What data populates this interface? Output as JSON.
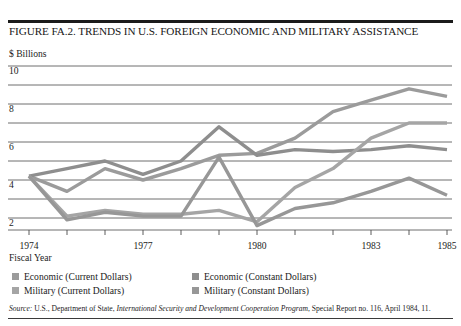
{
  "figure": {
    "title": "FIGURE FA.2. TRENDS IN U.S. FOREIGN ECONOMIC AND MILITARY ASSISTANCE",
    "source_prefix": "Source:",
    "source_part1": " U.S., Department of State, ",
    "source_italic": "International Security and Development Cooperation Program",
    "source_part2": ", Special Report no. 116, April 1984, 11."
  },
  "axes": {
    "y_unit": "$ Billions",
    "x_title": "Fiscal Year",
    "y_ticks": [
      "10",
      "8",
      "6",
      "4",
      "2"
    ],
    "x_ticks": [
      "1974",
      "1977",
      "1980",
      "1983",
      "1985"
    ]
  },
  "legend": {
    "items": [
      {
        "label": "Economic (Current Dollars)",
        "color": "#9b9b9b"
      },
      {
        "label": "Economic (Constant Dollars)",
        "color": "#8e8e8e"
      },
      {
        "label": "Military (Current Dollars)",
        "color": "#a5a5a5"
      },
      {
        "label": "Military (Constant Dollars)",
        "color": "#979797"
      }
    ]
  },
  "chart_data": {
    "type": "line",
    "title": "FIGURE FA.2. TRENDS IN U.S. FOREIGN ECONOMIC AND MILITARY ASSISTANCE",
    "xlabel": "Fiscal Year",
    "ylabel": "$ Billions",
    "xlim": [
      1974,
      1985
    ],
    "ylim": [
      1.2,
      10.4
    ],
    "yticks": [
      2,
      4,
      6,
      8,
      10
    ],
    "y_gridlines": [
      2,
      3,
      4,
      5,
      6,
      7,
      8,
      9,
      10
    ],
    "xticks": [
      1974,
      1977,
      1980,
      1983,
      1985
    ],
    "x_tickmarks": [
      1974,
      1975,
      1976,
      1977,
      1978,
      1979,
      1980,
      1981,
      1982,
      1983,
      1984,
      1985
    ],
    "grid": true,
    "legend_position": "below",
    "x": [
      1974,
      1975,
      1976,
      1977,
      1978,
      1979,
      1980,
      1981,
      1982,
      1983,
      1984,
      1985
    ],
    "series": [
      {
        "name": "Economic (Current Dollars)",
        "color": "#9b9b9b",
        "values": [
          4.2,
          3.4,
          4.6,
          4.0,
          4.6,
          5.3,
          5.4,
          6.2,
          7.6,
          8.2,
          8.8,
          8.4
        ]
      },
      {
        "name": "Economic (Constant Dollars)",
        "color": "#8e8e8e",
        "values": [
          4.2,
          4.6,
          5.0,
          4.3,
          5.0,
          6.8,
          5.3,
          5.6,
          5.5,
          5.6,
          5.8,
          5.6
        ]
      },
      {
        "name": "Military (Current Dollars)",
        "color": "#a5a5a5",
        "values": [
          4.2,
          2.1,
          2.4,
          2.2,
          2.2,
          2.4,
          1.8,
          3.6,
          4.6,
          6.2,
          7.0,
          7.0
        ]
      },
      {
        "name": "Military (Constant Dollars)",
        "color": "#979797",
        "values": [
          4.2,
          1.9,
          2.3,
          2.1,
          2.1,
          5.2,
          1.6,
          2.5,
          2.8,
          3.4,
          4.1,
          3.2
        ]
      }
    ]
  }
}
